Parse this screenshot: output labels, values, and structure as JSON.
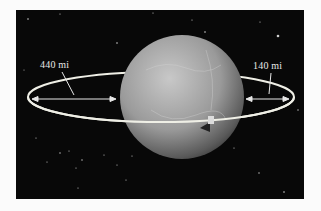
{
  "figure": {
    "labels": {
      "left_distance": "440 mi",
      "right_distance": "140 mi"
    },
    "colors": {
      "background": "#080808",
      "ring": "#efefe6",
      "planet_light": "#bdbdbd",
      "planet_dark": "#3a3a3a"
    }
  }
}
